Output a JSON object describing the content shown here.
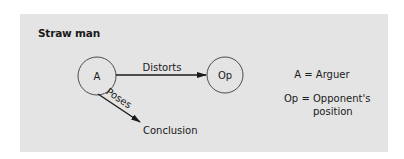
{
  "figure": {
    "title": "Straw man",
    "background_color": "#e4e4e4",
    "stroke_color": "#1a1a1a"
  },
  "nodes": [
    {
      "id": "A",
      "label": "A",
      "cx": 97,
      "cy": 76,
      "r": 19
    },
    {
      "id": "Op",
      "label": "Op",
      "cx": 225,
      "cy": 75,
      "r": 18
    }
  ],
  "edges": [
    {
      "from": "A",
      "to": "Op",
      "label": "Distorts"
    },
    {
      "from": "A",
      "to": "Conclusion",
      "label": "Poses"
    }
  ],
  "targets": {
    "conclusion": "Conclusion"
  },
  "legend": {
    "items": [
      {
        "key": "A",
        "equals": "=",
        "value": "Arguer"
      },
      {
        "key": "Op",
        "equals": "=",
        "value_line1": "Opponent's",
        "value_line2": "position"
      }
    ]
  }
}
